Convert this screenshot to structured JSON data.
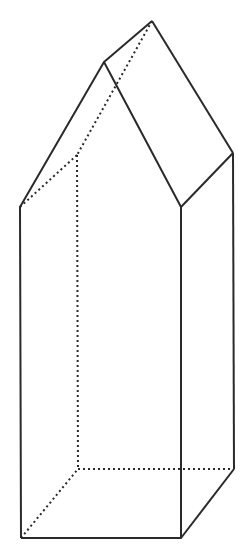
{
  "diagram": {
    "type": "pentagonal-prism-house-shape",
    "colors": {
      "background": "#ffffff",
      "stroke": "#2a2a2a"
    },
    "vertices": {
      "front_bottom_left": [
        21,
        538
      ],
      "front_bottom_right": [
        181,
        538
      ],
      "back_bottom_right": [
        234,
        469
      ],
      "back_bottom_left": [
        78,
        469
      ],
      "front_top_left": [
        20,
        207
      ],
      "front_top_right": [
        181,
        207
      ],
      "back_top_right": [
        233,
        153
      ],
      "back_top_left": [
        77,
        155
      ],
      "front_peak": [
        104,
        62
      ],
      "back_peak": [
        152,
        21
      ]
    }
  }
}
